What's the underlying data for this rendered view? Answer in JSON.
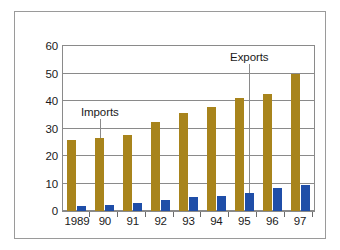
{
  "chart_data": {
    "type": "bar",
    "title": "",
    "subtitle": "",
    "xlabel": "",
    "ylabel": "",
    "categories": [
      "1989",
      "90",
      "91",
      "92",
      "93",
      "94",
      "95",
      "96",
      "97"
    ],
    "series": [
      {
        "name": "Imports",
        "color": "#a8841c",
        "values": [
          26,
          26.5,
          27.5,
          32.5,
          35.5,
          38,
          41,
          42.5,
          50
        ]
      },
      {
        "name": "Exports",
        "color": "#1f4ea8",
        "values": [
          1.7,
          2.3,
          3,
          4,
          5,
          5.5,
          6.5,
          8.2,
          9.5
        ]
      }
    ],
    "ylim": [
      0,
      60
    ],
    "yticks": [
      0,
      10,
      20,
      30,
      40,
      50,
      60
    ],
    "ytick_labels": [
      "0",
      "10",
      "20",
      "30",
      "40",
      "50",
      "60"
    ],
    "grid": true,
    "grid_axis": "y",
    "legend": "none",
    "annotations": [
      {
        "text": "Imports",
        "points_to_category": "90",
        "points_to_series": "Imports"
      },
      {
        "text": "Exports",
        "points_to_category": "95",
        "points_to_series": "Exports"
      }
    ]
  },
  "figure": {
    "border_color": "#9a9a9a",
    "background_color": "#ffffff",
    "plot_border_color": "#8a8a8a",
    "gridline_color": "#8a8a8a"
  }
}
